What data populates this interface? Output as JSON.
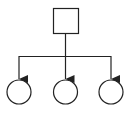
{
  "diagram": {
    "type": "tree",
    "stroke_color": "#222222",
    "background": "#ffffff",
    "root": {
      "shape": "square",
      "x": 53,
      "y": 8,
      "size": 25
    },
    "trunk": {
      "x": 65.5,
      "y1": 33,
      "y2": 56
    },
    "bus": {
      "y": 56,
      "x1": 19,
      "x2": 111
    },
    "children": [
      {
        "shape": "circle",
        "cx": 19,
        "cy": 92,
        "r": 12
      },
      {
        "shape": "circle",
        "cx": 65.5,
        "cy": 92,
        "r": 12
      },
      {
        "shape": "circle",
        "cx": 111,
        "cy": 92,
        "r": 12
      }
    ]
  }
}
